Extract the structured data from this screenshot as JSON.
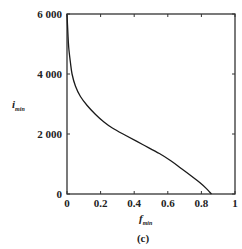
{
  "chart_data": {
    "type": "line",
    "title": "",
    "caption": "(c)",
    "xlabel": "f_min",
    "xlabel_main": "f",
    "xlabel_sub": "min",
    "ylabel": "i_min",
    "ylabel_main": "i",
    "ylabel_sub": "min",
    "xlim": [
      0,
      1
    ],
    "ylim": [
      0,
      6000
    ],
    "grid": false,
    "legend": null,
    "x_ticks": [
      0,
      0.2,
      0.4,
      0.6,
      0.8,
      1
    ],
    "x_tick_labels": [
      "0",
      "0.2",
      "0.4",
      "0.6",
      "0.8",
      "1"
    ],
    "y_ticks": [
      0,
      2000,
      4000,
      6000
    ],
    "y_tick_labels": [
      "0",
      "2 000",
      "4 000",
      "6 000"
    ],
    "series": [
      {
        "name": "i_min vs f_min",
        "color": "#1a1a1a",
        "x": [
          0.0,
          0.005,
          0.01,
          0.02,
          0.03,
          0.05,
          0.08,
          0.12,
          0.17,
          0.22,
          0.27,
          0.35,
          0.45,
          0.55,
          0.62,
          0.68,
          0.74,
          0.79,
          0.83,
          0.85,
          0.86
        ],
        "y": [
          6000,
          5400,
          4900,
          4400,
          4000,
          3600,
          3250,
          2950,
          2650,
          2400,
          2200,
          1950,
          1650,
          1350,
          1100,
          850,
          600,
          380,
          180,
          60,
          0
        ]
      }
    ]
  }
}
